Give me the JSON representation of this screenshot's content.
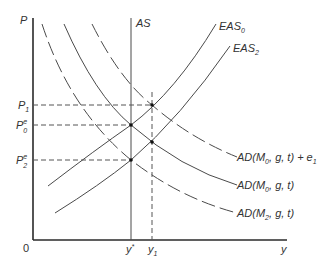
{
  "diagram": {
    "axes": {
      "y_axis_label": "P",
      "x_axis_label": "y",
      "origin_label": "0"
    },
    "price_levels": [
      {
        "id": "P1",
        "base": "P",
        "sub": "1",
        "sup": ""
      },
      {
        "id": "P0e",
        "base": "P",
        "sub": "0",
        "sup": "e"
      },
      {
        "id": "P2e",
        "base": "P",
        "sub": "2",
        "sup": "e"
      }
    ],
    "output_levels": [
      {
        "id": "ystar",
        "base": "y",
        "sup": "*",
        "sub": ""
      },
      {
        "id": "y1",
        "base": "y",
        "sub": "1",
        "sup": ""
      }
    ],
    "curves": {
      "AS": {
        "label": "AS",
        "style": "solid",
        "type": "vertical"
      },
      "EAS0": {
        "base": "EAS",
        "sub": "0",
        "style": "solid"
      },
      "EAS2": {
        "base": "EAS",
        "sub": "2",
        "style": "solid"
      },
      "AD_e1": {
        "pre": "AD(M",
        "sub": "0",
        "post": ", g, t) + e",
        "sub2": "1",
        "style": "dashed"
      },
      "AD_M0": {
        "pre": "AD(M",
        "sub": "0",
        "post": ", g, t)",
        "style": "solid"
      },
      "AD_M2": {
        "pre": "AD(M",
        "sub": "2",
        "post": ", g, t)",
        "style": "dashed"
      }
    },
    "equilibria": [
      {
        "name": "P1-y1",
        "on": [
          "EAS0",
          "AD_e1"
        ]
      },
      {
        "name": "P0e-ystar",
        "on": [
          "AS",
          "EAS0",
          "AD_M0"
        ]
      },
      {
        "name": "EAS2-AD_M0",
        "on": [
          "EAS2",
          "AD_M0"
        ]
      },
      {
        "name": "P2e-ystar",
        "on": [
          "AS",
          "EAS2",
          "AD_M2"
        ]
      }
    ]
  }
}
